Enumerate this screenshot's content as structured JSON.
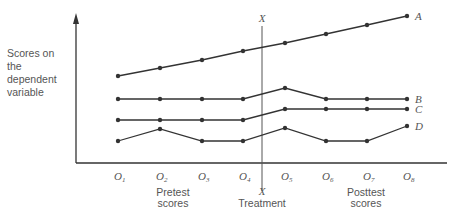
{
  "figure": {
    "y_axis_label_lines": [
      "Scores on",
      "the",
      "dependent",
      "variable"
    ],
    "treatment_top_label": "X",
    "treatment_bottom_label": "X",
    "treatment_caption": "Treatment",
    "pretest_caption_lines": [
      "Pretest",
      "scores"
    ],
    "posttest_caption_lines": [
      "Posttest",
      "scores"
    ],
    "observations": [
      "O1",
      "O2",
      "O3",
      "O4",
      "O5",
      "O6",
      "O7",
      "O8"
    ],
    "line_color": "#333333"
  },
  "chart_data": {
    "type": "line",
    "title": "",
    "xlabel": "Observations (pretest O1–O4, treatment X, posttest O5–O8)",
    "ylabel": "Scores on the dependent variable",
    "categories": [
      "O1",
      "O2",
      "O3",
      "O4",
      "O5",
      "O6",
      "O7",
      "O8"
    ],
    "treatment_between": [
      "O4",
      "O5"
    ],
    "grid": false,
    "legend_position": "inline-right",
    "series": [
      {
        "name": "A",
        "pixel_y": [
          76,
          68,
          60,
          51,
          43,
          34,
          25,
          16
        ]
      },
      {
        "name": "B",
        "pixel_y": [
          99,
          99,
          99,
          99,
          88,
          99,
          99,
          99
        ]
      },
      {
        "name": "C",
        "pixel_y": [
          120,
          120,
          120,
          120,
          109,
          109,
          109,
          109
        ]
      },
      {
        "name": "D",
        "pixel_y": [
          141,
          129,
          141,
          141,
          128,
          141,
          141,
          126
        ]
      }
    ],
    "x_pixels": [
      118,
      160,
      202,
      243,
      285,
      326,
      367,
      407
    ],
    "note": "Values are relative positions (no numeric y scale shown); lower pixel_y = higher score"
  }
}
